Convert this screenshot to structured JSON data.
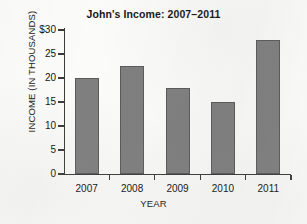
{
  "chart_data": {
    "type": "bar",
    "title": "John's Income: 2007–2011",
    "xlabel": "YEAR",
    "ylabel": "INCOME  (IN THOUSANDS)",
    "categories": [
      "2007",
      "2008",
      "2009",
      "2010",
      "2011"
    ],
    "values": [
      20,
      22.5,
      18,
      15,
      28
    ],
    "series": [
      {
        "name": "Income",
        "values": [
          20,
          22.5,
          18,
          15,
          28
        ]
      }
    ],
    "ylim": [
      0,
      30
    ],
    "y_ticks": [
      0,
      5,
      10,
      15,
      20,
      25,
      30
    ],
    "y_tick_labels": [
      "0",
      "5",
      "10",
      "15",
      "20",
      "25",
      "$30"
    ],
    "x_tick_labels": [
      "2007",
      "2008",
      "2009",
      "2010",
      "2011"
    ],
    "grid": false,
    "legend": false,
    "legend_position": "none",
    "bar_color": "#7f7f7f",
    "bar_edge_color": "#5a5a5a",
    "axis_color": "#3b3b3b",
    "background_color": "#fbfbf9",
    "units": "thousands of dollars"
  }
}
